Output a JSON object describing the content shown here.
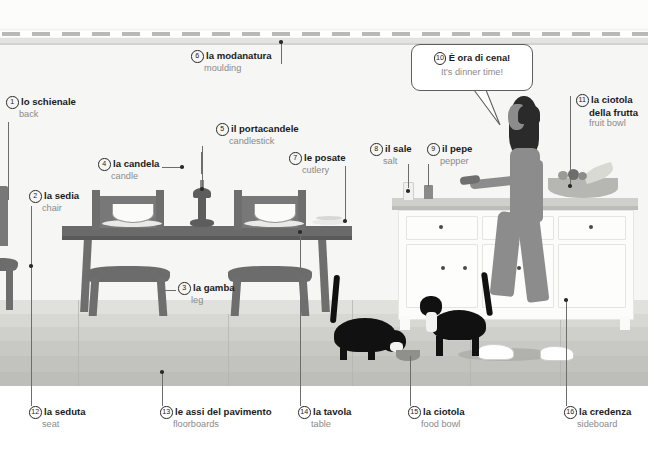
{
  "illustration": {
    "title": "Italian vocabulary illustration: dining room at dinner time",
    "colors": {
      "wall": "#f6f6f4",
      "floor": "#c8c8c5",
      "furniture_wood": "#6e6e6e",
      "cabinet_white": "#fcfcfb",
      "cat_black": "#111111",
      "woman_gray": "#8c8c8c",
      "label_italian": "#1b1b1b",
      "label_english": "#8a8a8a",
      "leader_line": "#6d6d6d"
    }
  },
  "speech_bubble": {
    "name": "dinner-time-bubble",
    "number": "10",
    "italian": "È ora di cena!",
    "english": "It's dinner time!"
  },
  "callouts": [
    {
      "number": "1",
      "italian": "lo schienale",
      "english": "back"
    },
    {
      "number": "2",
      "italian": "la sedia",
      "english": "chair"
    },
    {
      "number": "3",
      "italian": "la gamba",
      "english": "leg"
    },
    {
      "number": "4",
      "italian": "la candela",
      "english": "candle"
    },
    {
      "number": "5",
      "italian": "il portacandele",
      "english": "candlestick"
    },
    {
      "number": "6",
      "italian": "la modanatura",
      "english": "moulding"
    },
    {
      "number": "7",
      "italian": "le posate",
      "english": "cutlery"
    },
    {
      "number": "8",
      "italian": "il sale",
      "english": "salt"
    },
    {
      "number": "9",
      "italian": "il pepe",
      "english": "pepper"
    },
    {
      "number": "11",
      "italian": "la ciotola",
      "italian2": "della frutta",
      "english": "fruit bowl"
    },
    {
      "number": "12",
      "italian": "la seduta",
      "english": "seat"
    },
    {
      "number": "13",
      "italian": "le assi del pavimento",
      "english": "floorboards"
    },
    {
      "number": "14",
      "italian": "la tavola",
      "english": "table"
    },
    {
      "number": "15",
      "italian": "la ciotola",
      "english": "food bowl"
    },
    {
      "number": "16",
      "italian": "la credenza",
      "english": "sideboard"
    }
  ]
}
